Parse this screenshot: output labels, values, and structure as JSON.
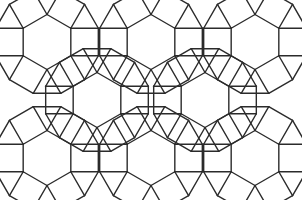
{
  "figure": {
    "name": "rhombitrihexagonal-tiling-patch",
    "title": "",
    "caption": "",
    "background_color": "#ffffff",
    "stroke_color": "#2b2b2b",
    "stroke_width": 1.4,
    "fill_color": "none",
    "width": 302,
    "height": 200
  },
  "diagram_data": {
    "type": "geometric-tiling",
    "vertex_configuration": "3.4.6.4",
    "tiling_name": "rhombitrihexagonal",
    "shapes": [
      "hexagon",
      "square",
      "triangle"
    ],
    "symmetry": "bilateral (left-right mirror)",
    "unit": 27.5,
    "geometry": {
      "hexagon_radius": 27.5,
      "square_side": 27.5,
      "triangle_side": 27.5,
      "centers_top_row_y": 42,
      "centers_mid_row_y": 100,
      "centers_bottom_row_y": 158,
      "rosette_void_centers": [
        [
          97,
          100
        ],
        [
          205,
          100
        ]
      ]
    },
    "hexagons": [
      {
        "id": "hex-top-left",
        "cx": 47,
        "cy": 42,
        "r": 27.5,
        "orientation": "pointy-top"
      },
      {
        "id": "hex-top-center",
        "cx": 151,
        "cy": 42,
        "r": 27.5,
        "orientation": "pointy-top"
      },
      {
        "id": "hex-top-right",
        "cx": 255,
        "cy": 42,
        "r": 27.5,
        "orientation": "pointy-top"
      },
      {
        "id": "hex-void-left",
        "cx": 97,
        "cy": 100,
        "r": 27.5,
        "orientation": "pointy-top"
      },
      {
        "id": "hex-void-right",
        "cx": 205,
        "cy": 100,
        "r": 27.5,
        "orientation": "pointy-top"
      },
      {
        "id": "hex-bottom-left",
        "cx": 47,
        "cy": 158,
        "r": 27.5,
        "orientation": "pointy-top"
      },
      {
        "id": "hex-bottom-center",
        "cx": 151,
        "cy": 158,
        "r": 27.5,
        "orientation": "pointy-top"
      },
      {
        "id": "hex-bottom-right",
        "cx": 255,
        "cy": 158,
        "r": 27.5,
        "orientation": "pointy-top"
      }
    ],
    "counts": {
      "hexagons": 8,
      "squares": 26,
      "triangles": 24
    },
    "labels": [],
    "annotations": []
  }
}
